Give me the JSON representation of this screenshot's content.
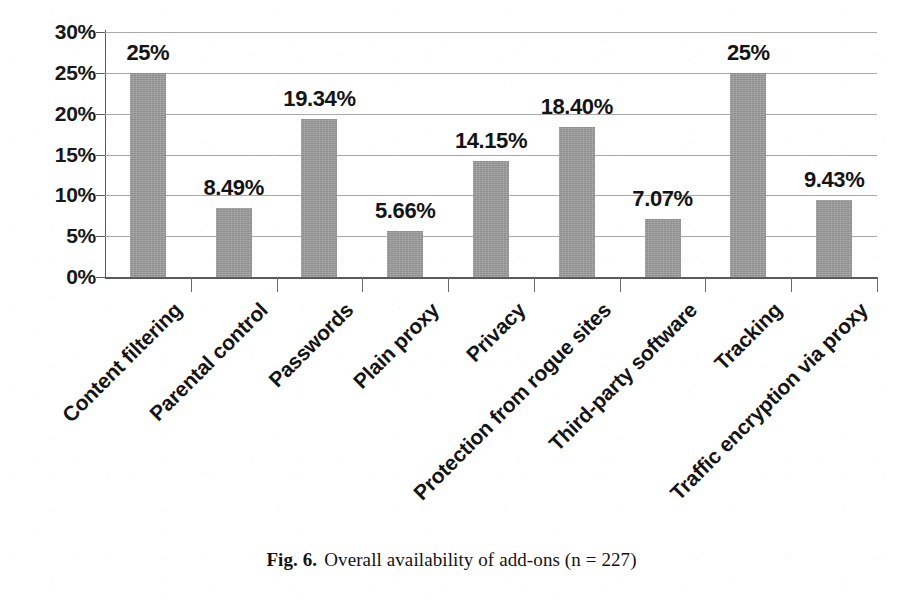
{
  "chart_data": {
    "type": "bar",
    "title": "",
    "xlabel": "",
    "ylabel": "",
    "ylim": [
      0,
      30
    ],
    "ytick_labels": [
      "0%",
      "5%",
      "10%",
      "15%",
      "20%",
      "25%",
      "30%"
    ],
    "ytick_values": [
      0,
      5,
      10,
      15,
      20,
      25,
      30
    ],
    "grid": true,
    "legend": false,
    "categories": [
      "Content filtering",
      "Parental control",
      "Passwords",
      "Plain proxy",
      "Privacy",
      "Protection from rogue sites",
      "Third-party software",
      "Tracking",
      "Traffic encryption via proxy"
    ],
    "values": [
      25,
      8.49,
      19.34,
      5.66,
      14.15,
      18.4,
      7.07,
      25,
      9.43
    ],
    "value_labels": [
      "25%",
      "8.49%",
      "19.34%",
      "5.66%",
      "14.15%",
      "18.40%",
      "7.07%",
      "25%",
      "9.43%"
    ],
    "bar_color": "#9b9b9b",
    "gridline_color": "#a8a8a8",
    "axis_color": "#5a5a5c"
  },
  "caption": {
    "figure_number": "Fig. 6.",
    "text": "Overall availability of add-ons (n = 227)"
  }
}
